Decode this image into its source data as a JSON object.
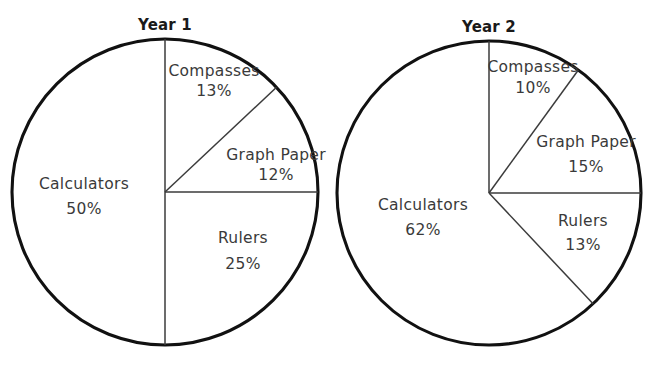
{
  "figure": {
    "title": "",
    "background_color": "#ffffff",
    "outline_color": "#111111",
    "divider_color": "#3b3b3b",
    "label_color": "#3a3a3a",
    "title_color": "#1a1a1a"
  },
  "charts": [
    {
      "title": "Year 1",
      "center_x": 165,
      "center_y": 192,
      "radius": 153,
      "slices": [
        {
          "label": "Compasses",
          "value": "13%",
          "percent": 13,
          "label_x": 214,
          "label_y": 76,
          "value_x": 214,
          "value_y": 96
        },
        {
          "label": "Graph Paper",
          "value": "12%",
          "percent": 12,
          "label_x": 276,
          "label_y": 160,
          "value_x": 276,
          "value_y": 180
        },
        {
          "label": "Rulers",
          "value": "25%",
          "percent": 25,
          "label_x": 243,
          "label_y": 243,
          "value_x": 243,
          "value_y": 269
        },
        {
          "label": "Calculators",
          "value": "50%",
          "percent": 50,
          "label_x": 84,
          "label_y": 189,
          "value_x": 84,
          "value_y": 214
        }
      ]
    },
    {
      "title": "Year 2",
      "center_x": 489,
      "center_y": 193,
      "radius": 152,
      "slices": [
        {
          "label": "Compasses",
          "value": "10%",
          "percent": 10,
          "label_x": 533,
          "label_y": 72,
          "value_x": 533,
          "value_y": 93
        },
        {
          "label": "Graph Paper",
          "value": "15%",
          "percent": 15,
          "label_x": 586,
          "label_y": 147,
          "value_x": 586,
          "value_y": 172
        },
        {
          "label": "Rulers",
          "value": "13%",
          "percent": 13,
          "label_x": 583,
          "label_y": 226,
          "value_x": 583,
          "value_y": 250
        },
        {
          "label": "Calculators",
          "value": "62%",
          "percent": 62,
          "label_x": 423,
          "label_y": 210,
          "value_x": 423,
          "value_y": 235
        }
      ]
    }
  ],
  "chart_data": [
    {
      "type": "pie",
      "title": "Year 1",
      "categories": [
        "Compasses",
        "Graph Paper",
        "Rulers",
        "Calculators"
      ],
      "values": [
        13,
        12,
        25,
        50
      ],
      "value_labels": [
        "13%",
        "12%",
        "25%",
        "50%"
      ],
      "unit": "percent",
      "start_angle_deg": 0,
      "direction": "clockwise",
      "legend": "none",
      "labels_position": "inside-slice",
      "xlabel": "",
      "ylabel": ""
    },
    {
      "type": "pie",
      "title": "Year 2",
      "categories": [
        "Compasses",
        "Graph Paper",
        "Rulers",
        "Calculators"
      ],
      "values": [
        10,
        15,
        13,
        62
      ],
      "value_labels": [
        "10%",
        "15%",
        "13%",
        "62%"
      ],
      "unit": "percent",
      "start_angle_deg": 0,
      "direction": "clockwise",
      "legend": "none",
      "labels_position": "inside-slice",
      "xlabel": "",
      "ylabel": ""
    }
  ]
}
